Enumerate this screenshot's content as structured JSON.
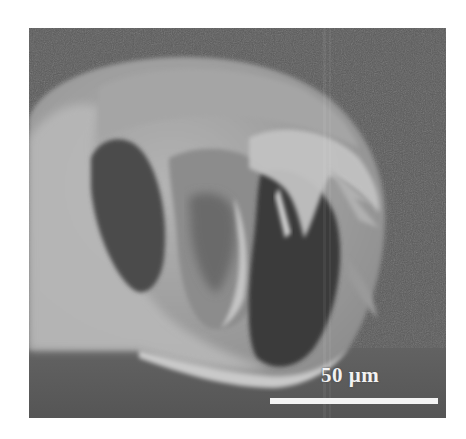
{
  "figure": {
    "type": "SEM micrograph",
    "scale_bar": {
      "label": "50 µm",
      "color": "#f4f4f4"
    },
    "colors": {
      "background": "#5b5b5b",
      "fiber_wall": "#a8a8a8",
      "lumen": "#3e3e3e",
      "page": "#ffffff"
    }
  }
}
